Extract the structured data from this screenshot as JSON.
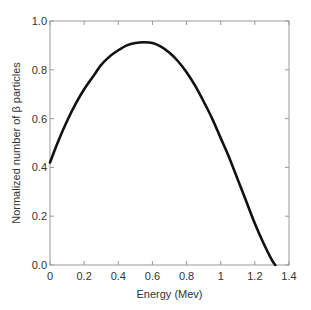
{
  "chart_data": {
    "type": "line",
    "title": "",
    "xlabel": "Energy (Mev)",
    "ylabel": "Normalized number of β particles",
    "xlim": [
      0,
      1.4
    ],
    "ylim": [
      0,
      1.0
    ],
    "grid": false,
    "legend": null,
    "x_ticks": [
      0,
      0.2,
      0.4,
      0.6,
      0.8,
      1,
      1.2,
      1.4
    ],
    "x_tick_labels": [
      "0",
      "0.2",
      "0.4",
      "0.6",
      "0.8",
      "1",
      "1.2",
      "1.4"
    ],
    "y_ticks": [
      0,
      0.2,
      0.4,
      0.6,
      0.8,
      1.0
    ],
    "y_tick_labels": [
      "0.0",
      "0.2",
      "0.4",
      "0.6",
      "0.8",
      "1.0"
    ],
    "series": [
      {
        "name": "beta spectrum",
        "color": "#111111",
        "x": [
          0.0,
          0.05,
          0.1,
          0.15,
          0.2,
          0.25,
          0.3,
          0.35,
          0.4,
          0.45,
          0.5,
          0.55,
          0.6,
          0.65,
          0.7,
          0.75,
          0.8,
          0.85,
          0.9,
          0.95,
          1.0,
          1.05,
          1.1,
          1.15,
          1.2,
          1.25,
          1.3,
          1.32
        ],
        "y": [
          0.42,
          0.51,
          0.59,
          0.66,
          0.72,
          0.77,
          0.82,
          0.855,
          0.88,
          0.9,
          0.91,
          0.913,
          0.91,
          0.895,
          0.87,
          0.835,
          0.79,
          0.735,
          0.67,
          0.6,
          0.52,
          0.44,
          0.35,
          0.26,
          0.17,
          0.09,
          0.02,
          0.0
        ]
      }
    ]
  }
}
